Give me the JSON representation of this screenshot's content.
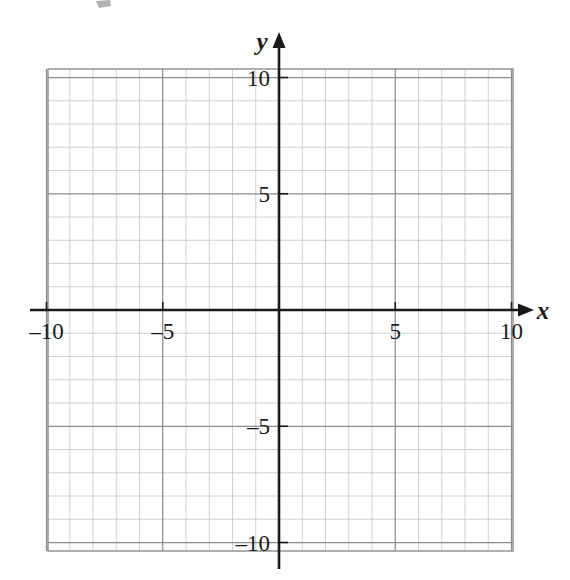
{
  "figure": {
    "kind": "cartesian-coordinate-grid",
    "background_color": "#ffffff"
  },
  "axes": {
    "x_label": "x",
    "y_label": "y",
    "axis_color": "#1a1a1a",
    "origin_px": {
      "x": 279,
      "y": 310
    },
    "unit_px": 23.25
  },
  "grid": {
    "minor_color": "#c4c4c4",
    "major_color": "#8c8c8c",
    "border_color": "#8c8c8c",
    "minor_step": 1,
    "major_step": 5,
    "left_px": 48,
    "right_px": 513,
    "top_px": 69,
    "bottom_px": 551
  },
  "chart_data": {
    "type": "scatter",
    "title": "",
    "xlabel": "x",
    "ylabel": "y",
    "xlim": [
      -10,
      10
    ],
    "ylim": [
      -10,
      10
    ],
    "xticks": [
      -10,
      -5,
      5,
      10
    ],
    "yticks": [
      -10,
      -5,
      5,
      10
    ],
    "xtick_labels": [
      "–10",
      "–5",
      "5",
      "10"
    ],
    "ytick_labels": [
      "–10",
      "–5",
      "5",
      "10"
    ],
    "minor_tick_step": 1,
    "major_tick_step": 5,
    "grid": true,
    "grid_minor": true,
    "legend": false,
    "series": [
      {
        "name": "",
        "x": [],
        "y": []
      }
    ],
    "annotations": []
  },
  "ticks": {
    "x": [
      {
        "value": -10,
        "label": "–10",
        "px": 48
      },
      {
        "value": -5,
        "label": "–5",
        "px": 164
      },
      {
        "value": 5,
        "label": "5",
        "px": 396
      },
      {
        "value": 10,
        "label": "10",
        "px": 513
      }
    ],
    "y": [
      {
        "value": 10,
        "label": "10",
        "px": 69
      },
      {
        "value": 5,
        "label": "5",
        "px": 190
      },
      {
        "value": -5,
        "label": "–5",
        "px": 431
      },
      {
        "value": -10,
        "label": "–10",
        "px": 551
      }
    ]
  }
}
